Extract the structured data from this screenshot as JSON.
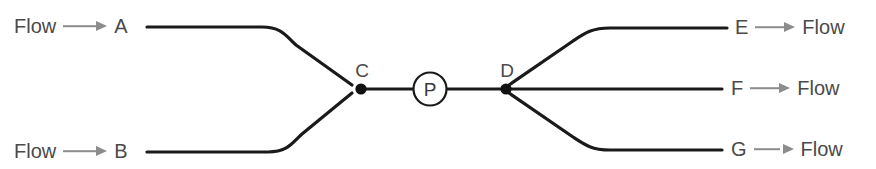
{
  "diagram": {
    "type": "pipe-network-schematic",
    "background_color": "#ffffff",
    "line_color": "#1a1a1a",
    "text_color": "#4a4a4a",
    "arrow_color": "#8c8c8c",
    "flow_word": "Flow",
    "inlets": [
      {
        "id": "A",
        "label": "A",
        "flow_label": "Flow",
        "position": "top-left"
      },
      {
        "id": "B",
        "label": "B",
        "flow_label": "Flow",
        "position": "bottom-left"
      }
    ],
    "junctions": [
      {
        "id": "C",
        "label": "C",
        "role": "merge-node"
      },
      {
        "id": "D",
        "label": "D",
        "role": "split-node"
      }
    ],
    "equipment": [
      {
        "id": "P",
        "label": "P",
        "symbol": "circled-letter",
        "role": "pump"
      }
    ],
    "outlets": [
      {
        "id": "E",
        "label": "E",
        "flow_label": "Flow",
        "position": "top-right"
      },
      {
        "id": "F",
        "label": "F",
        "flow_label": "Flow",
        "position": "middle-right"
      },
      {
        "id": "G",
        "label": "G",
        "flow_label": "Flow",
        "position": "bottom-right"
      }
    ]
  }
}
